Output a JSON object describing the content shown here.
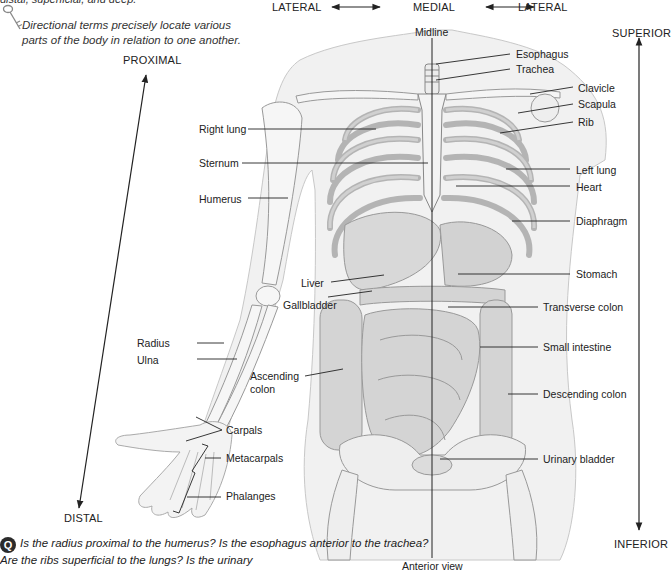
{
  "header": {
    "cut_off_line": "distal, superficial, and deep.",
    "key_note": "Directional terms precisely locate various parts of the body in relation to one another.",
    "key_icon": "key-icon"
  },
  "directions": {
    "lateral_left": "LATERAL",
    "medial": "MEDIAL",
    "lateral_right": "LATERAL",
    "midline": "Midline",
    "superior": "SUPERIOR",
    "inferior": "INFERIOR",
    "proximal": "PROXIMAL",
    "distal": "DISTAL"
  },
  "labels": {
    "left_side": [
      {
        "id": "right-lung",
        "text": "Right lung"
      },
      {
        "id": "sternum",
        "text": "Sternum"
      },
      {
        "id": "humerus",
        "text": "Humerus"
      },
      {
        "id": "liver",
        "text": "Liver"
      },
      {
        "id": "gallbladder",
        "text": "Gallbladder"
      },
      {
        "id": "radius",
        "text": "Radius"
      },
      {
        "id": "ulna",
        "text": "Ulna"
      },
      {
        "id": "ascending-colon",
        "text": "Ascending colon",
        "line1": "Ascending",
        "line2": "colon"
      },
      {
        "id": "carpals",
        "text": "Carpals"
      },
      {
        "id": "metacarpals",
        "text": "Metacarpals"
      },
      {
        "id": "phalanges",
        "text": "Phalanges"
      }
    ],
    "right_side": [
      {
        "id": "esophagus",
        "text": "Esophagus"
      },
      {
        "id": "trachea",
        "text": "Trachea"
      },
      {
        "id": "clavicle",
        "text": "Clavicle"
      },
      {
        "id": "scapula",
        "text": "Scapula"
      },
      {
        "id": "rib",
        "text": "Rib"
      },
      {
        "id": "left-lung",
        "text": "Left lung"
      },
      {
        "id": "heart",
        "text": "Heart"
      },
      {
        "id": "diaphragm",
        "text": "Diaphragm"
      },
      {
        "id": "stomach",
        "text": "Stomach"
      },
      {
        "id": "transverse-colon",
        "text": "Transverse colon"
      },
      {
        "id": "small-intestine",
        "text": "Small intestine"
      },
      {
        "id": "descending-colon",
        "text": "Descending colon"
      },
      {
        "id": "urinary-bladder",
        "text": "Urinary bladder"
      }
    ]
  },
  "view_label": "Anterior view",
  "question": {
    "badge": "Q",
    "text": "Is the radius proximal to the humerus? Is the esophagus anterior to the trachea? Are the ribs superficial to the lungs? Is the urinary"
  },
  "colors": {
    "line": "#222222",
    "body_fill": "#ececec",
    "bone_fill": "#f4f4f4",
    "bone_stroke": "#9a9a9a",
    "organ_fill": "#d6d6d6",
    "skin_stroke": "#c8c8c8"
  }
}
